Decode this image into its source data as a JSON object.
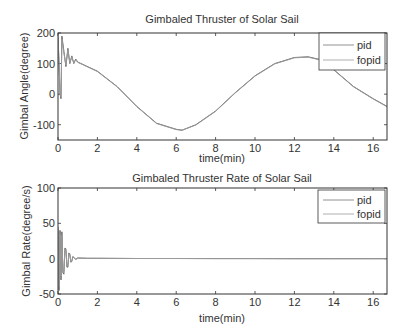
{
  "chart_data": [
    {
      "type": "line",
      "title": "Gimbaled Thruster of Solar Sail",
      "xlabel": "time(min)",
      "ylabel": "Gimbal Angle(degree)",
      "xlim": [
        0,
        16.7
      ],
      "ylim": [
        -150,
        200
      ],
      "xticks": [
        0,
        2,
        4,
        6,
        8,
        10,
        12,
        14,
        16
      ],
      "yticks": [
        -100,
        0,
        100,
        200
      ],
      "xtick_labels": [
        "0",
        "2",
        "4",
        "6",
        "8",
        "10",
        "12",
        "14",
        "16"
      ],
      "ytick_labels": [
        "-100",
        "0",
        "100",
        "200"
      ],
      "grid": false,
      "legend": {
        "position": "upper right",
        "entries": [
          "pid",
          "fopid"
        ]
      },
      "series": [
        {
          "name": "pid",
          "x": [
            0,
            0.05,
            0.1,
            0.15,
            0.2,
            0.3,
            0.4,
            0.5,
            0.6,
            0.7,
            0.8,
            0.9,
            1.0,
            2,
            3,
            4,
            5,
            6,
            6.3,
            7,
            8,
            9,
            10,
            11,
            12,
            12.7,
            13.5,
            14,
            15,
            16,
            16.7
          ],
          "y": [
            190,
            100,
            0,
            -15,
            190,
            140,
            90,
            150,
            100,
            125,
            100,
            115,
            105,
            75,
            25,
            -40,
            -95,
            -115,
            -118,
            -100,
            -55,
            5,
            60,
            100,
            120,
            122,
            110,
            80,
            25,
            -15,
            -40
          ]
        },
        {
          "name": "fopid",
          "x": [
            0,
            0.05,
            0.1,
            0.15,
            0.2,
            0.3,
            0.4,
            0.5,
            0.6,
            0.7,
            0.8,
            0.9,
            1.0,
            2,
            3,
            4,
            5,
            6,
            6.3,
            7,
            8,
            9,
            10,
            11,
            12,
            12.7,
            13.5,
            14,
            15,
            16,
            16.7
          ],
          "y": [
            185,
            105,
            10,
            -10,
            180,
            135,
            95,
            145,
            103,
            122,
            102,
            113,
            104,
            74,
            24,
            -41,
            -96,
            -116,
            -118,
            -101,
            -56,
            4,
            59,
            99,
            119,
            121,
            109,
            79,
            24,
            -16,
            -41
          ]
        }
      ]
    },
    {
      "type": "line",
      "title": "Gimbaled Thruster Rate of Solar Sail",
      "xlabel": "time(min)",
      "ylabel": "Gimbal Rate(degree/s)",
      "xlim": [
        0,
        16.7
      ],
      "ylim": [
        -50,
        100
      ],
      "xticks": [
        0,
        2,
        4,
        6,
        8,
        10,
        12,
        14,
        16
      ],
      "yticks": [
        -50,
        0,
        50,
        100
      ],
      "xtick_labels": [
        "0",
        "2",
        "4",
        "6",
        "8",
        "10",
        "12",
        "14",
        "16"
      ],
      "ytick_labels": [
        "-50",
        "0",
        "50",
        "100"
      ],
      "grid": false,
      "legend": {
        "position": "upper right",
        "entries": [
          "pid",
          "fopid"
        ]
      },
      "series": [
        {
          "name": "pid",
          "x": [
            0,
            0.05,
            0.1,
            0.15,
            0.2,
            0.25,
            0.3,
            0.35,
            0.4,
            0.45,
            0.5,
            0.55,
            0.6,
            0.65,
            0.7,
            0.75,
            0.8,
            0.9,
            1.0,
            1.5,
            2,
            4,
            6,
            8,
            10,
            12,
            14,
            16,
            16.7
          ],
          "y": [
            45,
            -45,
            40,
            -30,
            38,
            -20,
            -22,
            15,
            14,
            -12,
            -12,
            8,
            7,
            -5,
            -4,
            3,
            2,
            -1,
            1,
            0.5,
            0.5,
            0.3,
            0.2,
            0.1,
            0.1,
            0,
            0,
            0,
            0
          ]
        },
        {
          "name": "fopid",
          "x": [
            0,
            0.05,
            0.1,
            0.15,
            0.2,
            0.25,
            0.3,
            0.35,
            0.4,
            0.45,
            0.5,
            0.55,
            0.6,
            0.65,
            0.7,
            0.75,
            0.8,
            0.9,
            1.0,
            1.5,
            2,
            4,
            6,
            8,
            10,
            12,
            14,
            16,
            16.7
          ],
          "y": [
            40,
            -40,
            35,
            -25,
            33,
            -17,
            -18,
            13,
            12,
            -10,
            -10,
            7,
            6,
            -4,
            -3,
            2,
            2,
            -1,
            1,
            0.5,
            0.5,
            0.3,
            0.2,
            0.1,
            0.1,
            0,
            0,
            0,
            0
          ]
        }
      ]
    }
  ]
}
